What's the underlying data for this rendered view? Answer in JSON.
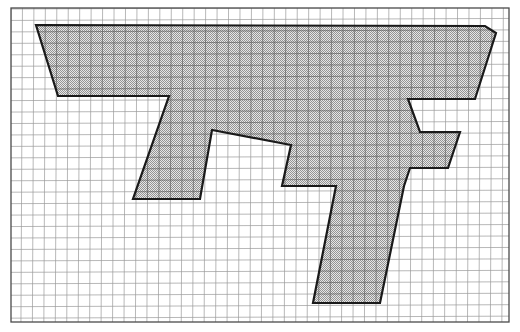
{
  "page": {
    "background_color": "#ffffff",
    "width": 520,
    "height": 332
  },
  "graph_paper": {
    "name": "grid-paper",
    "border_color": "#4a4a4a",
    "minor_line_color": "#8c8c8c",
    "major_line_color": "#3c3c3c",
    "minor_spacing_px": 11.45,
    "major_every": 1,
    "sheet": {
      "x": 11,
      "y": 8,
      "width": 498,
      "height": 314
    },
    "columns": 43,
    "rows": 27
  },
  "polygon": {
    "name": "shaded-polygon",
    "outline_color": "#1a1a1a",
    "outline_width_px": 2.2,
    "fill_description": "fine gray checkerboard stipple",
    "fill_color": "#a8a8a8",
    "fill_light": "#d9d9d9",
    "vertices": [
      [
        36,
        25
      ],
      [
        485,
        26
      ],
      [
        496,
        33
      ],
      [
        475,
        99
      ],
      [
        408,
        99
      ],
      [
        420,
        132
      ],
      [
        460,
        132
      ],
      [
        448,
        168
      ],
      [
        410,
        168
      ],
      [
        404,
        186
      ],
      [
        380,
        303
      ],
      [
        313,
        303
      ],
      [
        336,
        186
      ],
      [
        282,
        186
      ],
      [
        291,
        145
      ],
      [
        212,
        130
      ],
      [
        200,
        199
      ],
      [
        133,
        199
      ],
      [
        169,
        96
      ],
      [
        58,
        96
      ]
    ]
  },
  "legend": {
    "shape_label": "",
    "note": ""
  }
}
